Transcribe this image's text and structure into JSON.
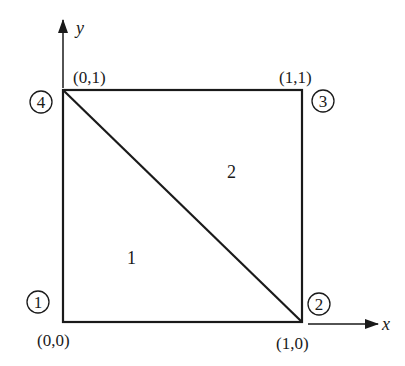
{
  "diagram": {
    "type": "finite-element-mesh",
    "colors": {
      "stroke": "#1a1a1a",
      "background": "#ffffff"
    },
    "axes": {
      "x": {
        "label": "x"
      },
      "y": {
        "label": "y"
      }
    },
    "nodes": [
      {
        "id": "1",
        "label": "1",
        "coord_label": "(0,0)"
      },
      {
        "id": "2",
        "label": "2",
        "coord_label": "(1,0)"
      },
      {
        "id": "3",
        "label": "3",
        "coord_label": "(1,1)"
      },
      {
        "id": "4",
        "label": "4",
        "coord_label": "(0,1)"
      }
    ],
    "elements": [
      {
        "id": "1",
        "label": "1",
        "nodes": [
          "1",
          "2",
          "4"
        ]
      },
      {
        "id": "2",
        "label": "2",
        "nodes": [
          "2",
          "3",
          "4"
        ]
      }
    ]
  }
}
